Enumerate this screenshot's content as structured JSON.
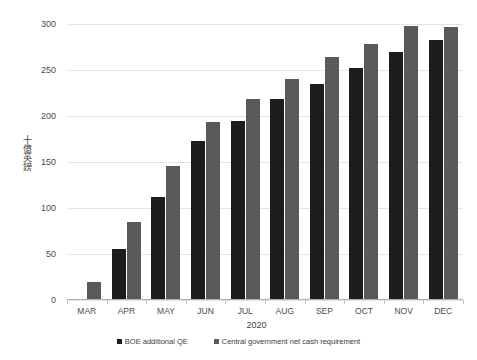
{
  "chart_data": {
    "type": "bar",
    "title": "",
    "subtitle": "",
    "xlabel": "2020",
    "ylabel": "十億英鎊",
    "categories": [
      "MAR",
      "APR",
      "MAY",
      "JUN",
      "JUL",
      "AUG",
      "SEP",
      "OCT",
      "NOV",
      "DEC"
    ],
    "series": [
      {
        "name": "BOE additional QE",
        "color": "#1c1c1c",
        "values": [
          0,
          55,
          112,
          173,
          195,
          218,
          235,
          252,
          270,
          283
        ]
      },
      {
        "name": "Central government net cash requirement",
        "color": "#5a5a5a",
        "values": [
          20,
          85,
          146,
          193,
          218,
          240,
          264,
          278,
          298,
          297
        ]
      }
    ],
    "ylim": [
      0,
      300
    ],
    "yticks": [
      0,
      50,
      100,
      150,
      200,
      250,
      300
    ],
    "ytick_labels": [
      "0",
      "50",
      "100",
      "150",
      "200",
      "250",
      "300"
    ],
    "grid": true,
    "legend_position": "bottom"
  },
  "legend": {
    "items": [
      {
        "label": "BOE additional QE",
        "color": "#1c1c1c"
      },
      {
        "label": "Central government net cash requirement",
        "color": "#5a5a5a"
      }
    ]
  }
}
